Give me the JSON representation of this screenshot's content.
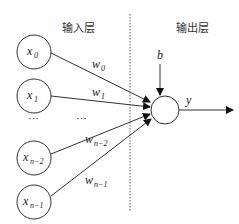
{
  "diagram": {
    "layers": {
      "input_label": "输入层",
      "output_label": "输出层"
    },
    "inputs": [
      {
        "var": "x",
        "sub": "0",
        "weight_var": "w",
        "weight_sub": "0"
      },
      {
        "var": "x",
        "sub": "1",
        "weight_var": "w",
        "weight_sub": "1"
      },
      {
        "var": "x",
        "sub": "n−2",
        "weight_var": "w",
        "weight_sub": "n−2"
      },
      {
        "var": "x",
        "sub": "n−1",
        "weight_var": "w",
        "weight_sub": "n−1"
      }
    ],
    "ellipsis_inputs": "···",
    "ellipsis_weights": "···",
    "bias_label": "b",
    "output_label": "y",
    "colors": {
      "stroke": "#333333",
      "background": "#ffffff"
    }
  }
}
